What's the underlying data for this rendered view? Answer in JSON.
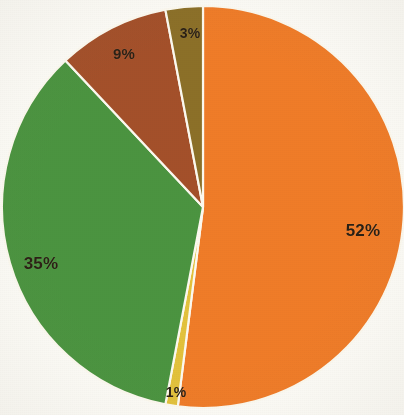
{
  "chart_data": {
    "type": "pie",
    "title": "",
    "subtitle": "",
    "xlabel": "",
    "ylabel": "",
    "grid": false,
    "legend": "none",
    "start_angle_deg": 0,
    "direction": "clockwise",
    "units": "percent",
    "categories": [
      "Segment 1",
      "Segment 2",
      "Segment 3",
      "Segment 4",
      "Segment 5"
    ],
    "values": [
      52,
      1,
      35,
      9,
      3
    ],
    "labels": [
      "52%",
      "1%",
      "35%",
      "9%",
      "3%"
    ],
    "colors": [
      "#F07C28",
      "#E3C23C",
      "#4B9440",
      "#A4502A",
      "#8C7028"
    ],
    "slices": [
      {
        "name": "slice-orange",
        "label": "52%",
        "value": 52,
        "color": "#F07C28",
        "label_x": 363,
        "label_y": 231
      },
      {
        "name": "slice-yellow",
        "label": "1%",
        "value": 1,
        "color": "#E3C23C",
        "label_x": 176,
        "label_y": 392
      },
      {
        "name": "slice-green",
        "label": "35%",
        "value": 35,
        "color": "#4B9440",
        "label_x": 41,
        "label_y": 264
      },
      {
        "name": "slice-brown",
        "label": "9%",
        "value": 9,
        "color": "#A4502A",
        "label_x": 124,
        "label_y": 53
      },
      {
        "name": "slice-olive",
        "label": "3%",
        "value": 3,
        "color": "#8C7028",
        "label_x": 190,
        "label_y": 33
      }
    ],
    "geometry": {
      "center_x": 203,
      "center_y": 207,
      "radius": 201
    },
    "style": {
      "background": "#fdfcf7",
      "separator_color": "#fdfaf0",
      "label_color": "#2b2014"
    }
  }
}
